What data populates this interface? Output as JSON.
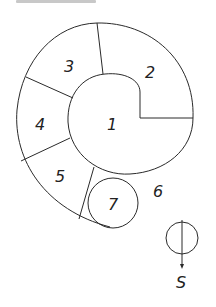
{
  "diagram": {
    "caption": "",
    "regions": [
      {
        "id": "1",
        "label": "1",
        "x": 112,
        "y": 128
      },
      {
        "id": "2",
        "label": "2",
        "x": 150,
        "y": 78
      },
      {
        "id": "3",
        "label": "3",
        "x": 70,
        "y": 70
      },
      {
        "id": "4",
        "label": "4",
        "x": 40,
        "y": 128
      },
      {
        "id": "5",
        "label": "5",
        "x": 60,
        "y": 180
      },
      {
        "id": "6",
        "label": "6",
        "x": 158,
        "y": 196
      },
      {
        "id": "7",
        "label": "7",
        "x": 113,
        "y": 208
      }
    ],
    "compass": {
      "direction_label": "S"
    }
  }
}
